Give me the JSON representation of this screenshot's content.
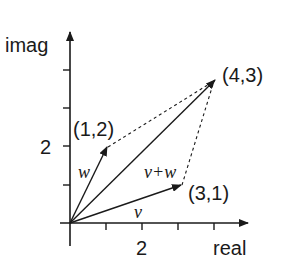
{
  "diagram": {
    "axes": {
      "x_label": "real",
      "y_label": "imag",
      "x_tick_label": "2",
      "y_tick_label": "2"
    },
    "points": {
      "w_tip": "(1,2)",
      "v_tip": "(3,1)",
      "sum_tip": "(4,3)"
    },
    "vectors": {
      "w": "w",
      "v": "v",
      "sum": "v+w"
    },
    "colors": {
      "ink": "#1a1a1a",
      "background": "#ffffff"
    }
  }
}
